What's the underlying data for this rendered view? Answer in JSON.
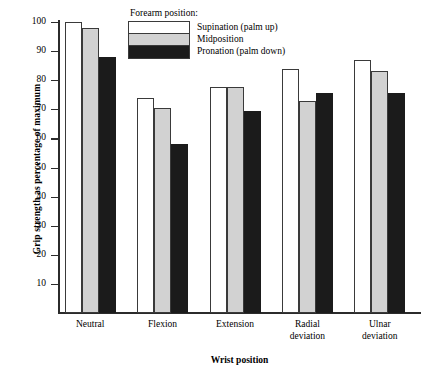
{
  "chart_data": {
    "type": "bar",
    "title": "",
    "xlabel": "Wrist position",
    "ylabel": "Grip strength as percentage of maximum",
    "categories": [
      "Neutral",
      "Flexion",
      "Extension",
      "Radial deviation",
      "Ulnar deviation"
    ],
    "category_labels": [
      [
        "Neutral"
      ],
      [
        "Flexion"
      ],
      [
        "Extension"
      ],
      [
        "Radial",
        "deviation"
      ],
      [
        "Ulnar",
        "deviation"
      ]
    ],
    "series": [
      {
        "name": "Supination (palm up)",
        "values": [
          100,
          74,
          77.5,
          84,
          87
        ]
      },
      {
        "name": "Midposition",
        "values": [
          98,
          70.5,
          77.5,
          73,
          83
        ]
      },
      {
        "name": "Pronation (palm down)",
        "values": [
          88,
          58,
          69.5,
          75.5,
          75.5
        ]
      }
    ],
    "ylim": [
      0,
      100
    ],
    "yticks": [
      10,
      20,
      30,
      40,
      50,
      60,
      70,
      80,
      90,
      100
    ],
    "ytick_labels": [
      "10",
      "20",
      "30",
      "40",
      "50",
      "60",
      "70",
      "80",
      "90",
      "100"
    ],
    "grid": false,
    "legend_position": "top-center",
    "legend_title": "Forearm position:",
    "colors": {
      "supination": "#ffffff",
      "midposition": "#d2d2d2",
      "pronation": "#1b1b1b",
      "axis": "#2b2b2b",
      "bar_outline": "#3a3a3a",
      "background": "#ffffff",
      "text": "#000000"
    }
  }
}
